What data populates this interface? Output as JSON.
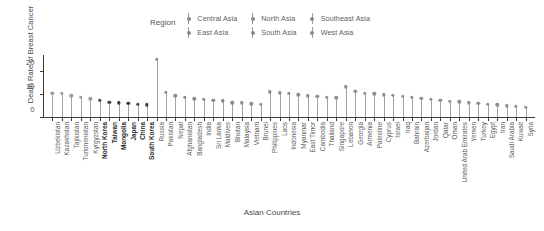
{
  "chart_data": {
    "type": "scatter",
    "plot_style": "lollipop",
    "title": "",
    "xlabel": "Asian Countries",
    "ylabel": "Death Rate of Breast Cancer",
    "ylim": [
      0,
      27
    ],
    "yticks": [
      0,
      10,
      20
    ],
    "grid": false,
    "legend": {
      "title": "Region",
      "position": "top",
      "entries": [
        {
          "label": "Central Asia",
          "color": "#9a9a9a"
        },
        {
          "label": "East Asia",
          "color": "#3f3f3f"
        },
        {
          "label": "North Asia",
          "color": "#8f8f8f"
        },
        {
          "label": "South Asia",
          "color": "#8a8a8a"
        },
        {
          "label": "Southeast Asia",
          "color": "#8f8f8f"
        },
        {
          "label": "West Asia",
          "color": "#909090"
        }
      ]
    },
    "categories": [
      "Uzbekistan",
      "Kazakhstan",
      "Tajikistan",
      "Turkmenistan",
      "Kyrgyzstan",
      "North Korea",
      "Taiwan",
      "Mongolia",
      "Japan",
      "China",
      "South Korea",
      "Russia",
      "Pakistan",
      "Nepal",
      "Afghanistan",
      "Bangladesh",
      "India",
      "Sri Lanka",
      "Maldives",
      "Bhutan",
      "Malaysia",
      "Vietnam",
      "Brunei",
      "Philippines",
      "Laos",
      "Indonesia",
      "Myanmar",
      "East Timor",
      "Cambodia",
      "Thailand",
      "Singapore",
      "Lebanon",
      "Georgia",
      "Armenia",
      "Palestine",
      "Cyprus",
      "Israel",
      "Iraq",
      "Bahrain",
      "Azerbaijan",
      "Jordan",
      "Qatar",
      "Oman",
      "United Arab Emirates",
      "Yemen",
      "Turkey",
      "Egypt",
      "Iran",
      "Saudi Arabia",
      "Kuwait",
      "Syria"
    ],
    "regions": [
      "Central Asia",
      "Central Asia",
      "Central Asia",
      "Central Asia",
      "Central Asia",
      "East Asia",
      "East Asia",
      "East Asia",
      "East Asia",
      "East Asia",
      "East Asia",
      "North Asia",
      "South Asia",
      "South Asia",
      "South Asia",
      "South Asia",
      "South Asia",
      "South Asia",
      "South Asia",
      "South Asia",
      "Southeast Asia",
      "Southeast Asia",
      "Southeast Asia",
      "Southeast Asia",
      "Southeast Asia",
      "Southeast Asia",
      "Southeast Asia",
      "Southeast Asia",
      "Southeast Asia",
      "Southeast Asia",
      "Southeast Asia",
      "West Asia",
      "West Asia",
      "West Asia",
      "West Asia",
      "West Asia",
      "West Asia",
      "West Asia",
      "West Asia",
      "West Asia",
      "West Asia",
      "West Asia",
      "West Asia",
      "West Asia",
      "West Asia",
      "West Asia",
      "West Asia",
      "West Asia",
      "West Asia",
      "West Asia",
      "West Asia"
    ],
    "values": [
      10.2,
      10.3,
      9.2,
      8.6,
      8.0,
      7.3,
      6.4,
      6.3,
      6.1,
      5.6,
      5.4,
      24.8,
      10.6,
      9.3,
      8.5,
      8.0,
      7.8,
      7.3,
      7.0,
      6.3,
      6.2,
      5.8,
      5.6,
      11.0,
      10.5,
      10.4,
      9.6,
      9.2,
      9.0,
      8.5,
      8.3,
      13.0,
      11.2,
      10.4,
      10.0,
      9.6,
      9.4,
      9.0,
      8.6,
      8.2,
      7.6,
      7.2,
      6.9,
      6.6,
      6.3,
      5.9,
      5.6,
      5.3,
      5.0,
      4.7,
      4.4
    ],
    "bold_labels": [
      "North Korea",
      "Taiwan",
      "Mongolia",
      "Japan",
      "China",
      "South Korea"
    ]
  }
}
